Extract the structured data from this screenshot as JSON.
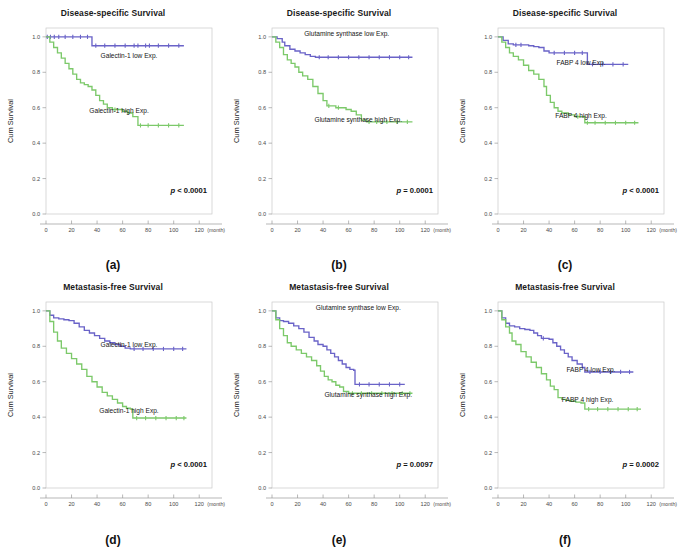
{
  "figure": {
    "axis": {
      "ylabel": "Cum Survival",
      "xunit": "(month)",
      "xticks": [
        "0",
        "20",
        "40",
        "60",
        "80",
        "100",
        "120"
      ],
      "yticks": [
        "0.0",
        "0.2",
        "0.4",
        "0.6",
        "0.8",
        "1.0"
      ],
      "xlim": [
        0,
        130
      ],
      "ylim": [
        0,
        1.05
      ]
    },
    "colors": {
      "low_expression": "#6a63c8",
      "high_expression": "#7cc96a",
      "frame": "#c9c9c9",
      "text": "#1a1a1a"
    },
    "panels": [
      {
        "letter": "(a)",
        "title": "Disease-specific Survival",
        "pvalue": "p < 0.0001",
        "labels": {
          "low": "Galectin-1 low Exp.",
          "high": "Galectin-1 high Exp."
        }
      },
      {
        "letter": "(b)",
        "title": "Disease-specific Survival",
        "pvalue": "p = 0.0001",
        "labels": {
          "low": "Glutamine synthase low Exp.",
          "high": "Glutamine synthase high Exp."
        }
      },
      {
        "letter": "(c)",
        "title": "Disease-specific Survival",
        "pvalue": "p < 0.0001",
        "labels": {
          "low": "FABP 4 low Exp.",
          "high": "FABP 4 high Exp."
        }
      },
      {
        "letter": "(d)",
        "title": "Metastasis-free Survival",
        "pvalue": "p < 0.0001",
        "labels": {
          "low": "Galectin-1 low Exp.",
          "high": "Galectin-1 high Exp."
        }
      },
      {
        "letter": "(e)",
        "title": "Metastasis-free Survival",
        "pvalue": "p = 0.0097",
        "labels": {
          "low": "Glutamine synthase low Exp.",
          "high": "Glutamine synthase high Exp."
        }
      },
      {
        "letter": "(f)",
        "title": "Metastasis-free Survival",
        "pvalue": "p = 0.0002",
        "labels": {
          "low": "FABP 4 low Exp.",
          "high": "FABP 4 high Exp."
        }
      }
    ]
  },
  "chart_data": [
    {
      "id": "a",
      "type": "line",
      "title": "Disease-specific Survival",
      "xlabel": "(month)",
      "ylabel": "Cum Survival",
      "xlim": [
        0,
        130
      ],
      "ylim": [
        0,
        1.05
      ],
      "grid": false,
      "annotations": [
        "p < 0.0001",
        "Galectin-1 low Exp.",
        "Galectin-1 high Exp."
      ],
      "series": [
        {
          "name": "Galectin-1 low Exp.",
          "color": "#6a63c8",
          "x": [
            0,
            2,
            5,
            8,
            12,
            18,
            24,
            30,
            35,
            36,
            42,
            50,
            58,
            66,
            75,
            84,
            92,
            100,
            108
          ],
          "y": [
            1.0,
            1.0,
            1.0,
            1.0,
            1.0,
            1.0,
            1.0,
            1.0,
            1.0,
            0.95,
            0.95,
            0.95,
            0.95,
            0.95,
            0.95,
            0.95,
            0.95,
            0.95,
            0.95
          ]
        },
        {
          "name": "Galectin-1 high Exp.",
          "color": "#7cc96a",
          "x": [
            0,
            3,
            6,
            9,
            12,
            15,
            18,
            21,
            24,
            27,
            30,
            33,
            36,
            39,
            42,
            45,
            48,
            52,
            56,
            60,
            64,
            68,
            72,
            76,
            84,
            92,
            100,
            108
          ],
          "y": [
            1.0,
            0.97,
            0.94,
            0.91,
            0.88,
            0.85,
            0.82,
            0.79,
            0.76,
            0.74,
            0.73,
            0.72,
            0.7,
            0.67,
            0.64,
            0.62,
            0.6,
            0.59,
            0.59,
            0.58,
            0.57,
            0.55,
            0.5,
            0.5,
            0.5,
            0.5,
            0.5,
            0.5
          ]
        }
      ]
    },
    {
      "id": "b",
      "type": "line",
      "title": "Disease-specific Survival",
      "xlabel": "(month)",
      "ylabel": "Cum Survival",
      "xlim": [
        0,
        130
      ],
      "ylim": [
        0,
        1.05
      ],
      "grid": false,
      "annotations": [
        "p = 0.0001",
        "Glutamine synthase low Exp.",
        "Glutamine synthase high Exp."
      ],
      "series": [
        {
          "name": "Glutamine synthase low Exp.",
          "color": "#6a63c8",
          "x": [
            0,
            4,
            8,
            10,
            14,
            18,
            22,
            26,
            30,
            34,
            40,
            48,
            56,
            64,
            72,
            80,
            88,
            96,
            104,
            110
          ],
          "y": [
            1.0,
            0.99,
            0.97,
            0.95,
            0.93,
            0.92,
            0.91,
            0.9,
            0.89,
            0.885,
            0.885,
            0.885,
            0.885,
            0.885,
            0.885,
            0.885,
            0.885,
            0.885,
            0.885,
            0.885
          ]
        },
        {
          "name": "Glutamine synthase high Exp.",
          "color": "#7cc96a",
          "x": [
            0,
            3,
            6,
            9,
            12,
            15,
            18,
            21,
            24,
            28,
            32,
            36,
            40,
            43,
            46,
            50,
            54,
            58,
            62,
            66,
            70,
            74,
            78,
            86,
            94,
            102,
            110
          ],
          "y": [
            1.0,
            0.97,
            0.94,
            0.9,
            0.87,
            0.85,
            0.83,
            0.8,
            0.78,
            0.76,
            0.72,
            0.68,
            0.64,
            0.61,
            0.61,
            0.6,
            0.6,
            0.59,
            0.58,
            0.56,
            0.53,
            0.52,
            0.52,
            0.52,
            0.52,
            0.52,
            0.52
          ]
        }
      ]
    },
    {
      "id": "c",
      "type": "line",
      "title": "Disease-specific Survival",
      "xlabel": "(month)",
      "ylabel": "Cum Survival",
      "xlim": [
        0,
        130
      ],
      "ylim": [
        0,
        1.05
      ],
      "grid": false,
      "annotations": [
        "p < 0.0001",
        "FABP 4 low Exp.",
        "FABP 4 high Exp."
      ],
      "series": [
        {
          "name": "FABP 4 low Exp.",
          "color": "#6a63c8",
          "x": [
            0,
            4,
            8,
            12,
            16,
            20,
            24,
            28,
            32,
            36,
            40,
            48,
            56,
            64,
            68,
            70,
            78,
            86,
            94,
            102
          ],
          "y": [
            1.0,
            0.98,
            0.96,
            0.955,
            0.955,
            0.955,
            0.95,
            0.945,
            0.94,
            0.92,
            0.91,
            0.91,
            0.91,
            0.91,
            0.91,
            0.845,
            0.845,
            0.845,
            0.845,
            0.845
          ]
        },
        {
          "name": "FABP 4 high Exp.",
          "color": "#7cc96a",
          "x": [
            0,
            3,
            6,
            9,
            12,
            16,
            20,
            24,
            28,
            32,
            36,
            38,
            41,
            44,
            47,
            50,
            55,
            60,
            65,
            68,
            72,
            80,
            88,
            96,
            104,
            110
          ],
          "y": [
            1.0,
            0.97,
            0.94,
            0.91,
            0.89,
            0.87,
            0.84,
            0.81,
            0.79,
            0.76,
            0.72,
            0.67,
            0.63,
            0.6,
            0.58,
            0.57,
            0.56,
            0.55,
            0.55,
            0.515,
            0.515,
            0.515,
            0.515,
            0.515,
            0.515,
            0.515
          ]
        }
      ]
    },
    {
      "id": "d",
      "type": "line",
      "title": "Metastasis-free Survival",
      "xlabel": "(month)",
      "ylabel": "Cum Survival",
      "xlim": [
        0,
        130
      ],
      "ylim": [
        0,
        1.05
      ],
      "grid": false,
      "annotations": [
        "p < 0.0001",
        "Galectin-1 low Exp.",
        "Galectin-1 high Exp."
      ],
      "series": [
        {
          "name": "Galectin-1 low Exp.",
          "color": "#6a63c8",
          "x": [
            0,
            3,
            6,
            10,
            14,
            18,
            22,
            26,
            30,
            34,
            38,
            42,
            46,
            50,
            54,
            58,
            62,
            66,
            72,
            80,
            88,
            96,
            104,
            110
          ],
          "y": [
            1.0,
            0.975,
            0.96,
            0.955,
            0.95,
            0.945,
            0.93,
            0.91,
            0.89,
            0.875,
            0.86,
            0.845,
            0.83,
            0.82,
            0.81,
            0.8,
            0.79,
            0.785,
            0.785,
            0.785,
            0.785,
            0.785,
            0.785,
            0.785
          ]
        },
        {
          "name": "Galectin-1 high Exp.",
          "color": "#7cc96a",
          "x": [
            0,
            3,
            6,
            9,
            12,
            16,
            20,
            24,
            28,
            32,
            36,
            40,
            44,
            48,
            52,
            56,
            60,
            63,
            66,
            68,
            74,
            82,
            90,
            98,
            106,
            110
          ],
          "y": [
            1.0,
            0.94,
            0.88,
            0.83,
            0.79,
            0.76,
            0.73,
            0.7,
            0.67,
            0.63,
            0.6,
            0.57,
            0.54,
            0.52,
            0.5,
            0.48,
            0.46,
            0.45,
            0.445,
            0.395,
            0.395,
            0.395,
            0.395,
            0.395,
            0.395,
            0.395
          ]
        }
      ]
    },
    {
      "id": "e",
      "type": "line",
      "title": "Metastasis-free Survival",
      "xlabel": "(month)",
      "ylabel": "Cum Survival",
      "xlim": [
        0,
        130
      ],
      "ylim": [
        0,
        1.05
      ],
      "grid": false,
      "annotations": [
        "p = 0.0097",
        "Glutamine synthase low Exp.",
        "Glutamine synthase high Exp."
      ],
      "series": [
        {
          "name": "Glutamine synthase low Exp.",
          "color": "#6a63c8",
          "x": [
            0,
            3,
            6,
            9,
            13,
            17,
            21,
            25,
            29,
            33,
            36,
            40,
            43,
            46,
            49,
            52,
            55,
            58,
            61,
            64,
            65,
            72,
            80,
            88,
            96,
            104
          ],
          "y": [
            1.0,
            0.96,
            0.945,
            0.94,
            0.93,
            0.915,
            0.9,
            0.88,
            0.85,
            0.83,
            0.81,
            0.8,
            0.78,
            0.76,
            0.74,
            0.72,
            0.7,
            0.68,
            0.67,
            0.665,
            0.585,
            0.585,
            0.585,
            0.585,
            0.585,
            0.585
          ]
        },
        {
          "name": "Glutamine synthase high Exp.",
          "color": "#7cc96a",
          "x": [
            0,
            3,
            6,
            9,
            12,
            15,
            19,
            23,
            27,
            31,
            35,
            38,
            41,
            44,
            47,
            50,
            53,
            56,
            60,
            66,
            74,
            82,
            90,
            98,
            106,
            110
          ],
          "y": [
            1.0,
            0.95,
            0.9,
            0.86,
            0.82,
            0.8,
            0.78,
            0.76,
            0.74,
            0.72,
            0.69,
            0.66,
            0.63,
            0.61,
            0.6,
            0.58,
            0.57,
            0.545,
            0.535,
            0.535,
            0.535,
            0.535,
            0.535,
            0.535,
            0.535,
            0.535
          ]
        }
      ]
    },
    {
      "id": "f",
      "type": "line",
      "title": "Metastasis-free Survival",
      "xlabel": "(month)",
      "ylabel": "Cum Survival",
      "xlim": [
        0,
        130
      ],
      "ylim": [
        0,
        1.05
      ],
      "grid": false,
      "annotations": [
        "p = 0.0002",
        "FABP 4 low Exp.",
        "FABP 4 high Exp."
      ],
      "series": [
        {
          "name": "FABP 4 low Exp.",
          "color": "#6a63c8",
          "x": [
            0,
            3,
            6,
            9,
            13,
            17,
            21,
            25,
            28,
            31,
            34,
            37,
            40,
            43,
            46,
            49,
            52,
            55,
            58,
            62,
            66,
            68,
            76,
            84,
            92,
            100,
            106
          ],
          "y": [
            1.0,
            0.96,
            0.93,
            0.915,
            0.91,
            0.9,
            0.895,
            0.89,
            0.875,
            0.86,
            0.845,
            0.845,
            0.84,
            0.82,
            0.8,
            0.78,
            0.76,
            0.74,
            0.72,
            0.7,
            0.68,
            0.655,
            0.655,
            0.655,
            0.655,
            0.655,
            0.655
          ]
        },
        {
          "name": "FABP 4 high Exp.",
          "color": "#7cc96a",
          "x": [
            0,
            3,
            6,
            9,
            11,
            14,
            18,
            22,
            26,
            30,
            34,
            38,
            41,
            44,
            47,
            50,
            53,
            57,
            61,
            65,
            68,
            74,
            82,
            90,
            98,
            106,
            112
          ],
          "y": [
            1.0,
            0.95,
            0.91,
            0.875,
            0.83,
            0.81,
            0.77,
            0.74,
            0.71,
            0.68,
            0.645,
            0.61,
            0.575,
            0.555,
            0.51,
            0.5,
            0.495,
            0.49,
            0.485,
            0.48,
            0.445,
            0.445,
            0.445,
            0.445,
            0.445,
            0.445,
            0.445
          ]
        }
      ]
    }
  ]
}
